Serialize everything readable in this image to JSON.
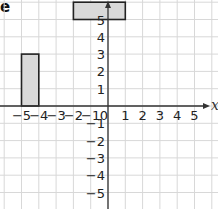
{
  "corner_text": "e",
  "chart_data": {
    "type": "diagram",
    "title": "",
    "xlabel": "x",
    "ylabel": "",
    "xlim": [
      -5.5,
      5.5
    ],
    "ylim": [
      -6,
      6
    ],
    "grid": true,
    "x_ticks": [
      "-5",
      "-4",
      "-3",
      "-2",
      "-1",
      "0",
      "1",
      "2",
      "3",
      "4",
      "5"
    ],
    "y_ticks": [
      "5",
      "4",
      "3",
      "2",
      "1",
      "-1",
      "-2",
      "-3",
      "-4",
      "-5"
    ],
    "shapes": [
      {
        "name": "left-rectangle",
        "x0": -5,
        "x1": -4,
        "y0": 0,
        "y1": 3,
        "fill": "#d9d9d9",
        "stroke": "#222222"
      },
      {
        "name": "top-rectangle",
        "x0": -2,
        "x1": 1,
        "y0": 5,
        "y1": 6,
        "fill": "#d9d9d9",
        "stroke": "#222222"
      }
    ]
  },
  "colors": {
    "grid": "#d8d8d8",
    "axis": "#333333",
    "shape_fill": "#d9d9d9",
    "shape_stroke": "#222222"
  }
}
